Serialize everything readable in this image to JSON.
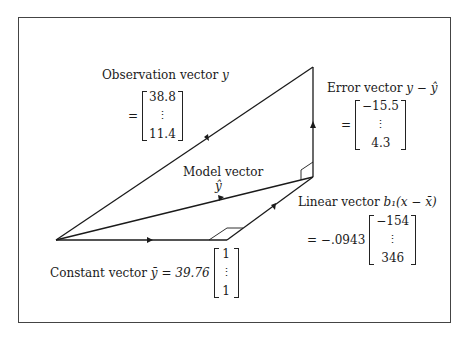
{
  "diagram": {
    "type": "vector-decomposition",
    "colors": {
      "line": "#1a1a1a",
      "frame": "#444444",
      "background": "#ffffff"
    },
    "observation": {
      "label": "Observation vector y",
      "label_text": "Observation vector",
      "symbol": "y",
      "prefix": "=",
      "matrix": [
        "38.8",
        "⋮",
        "11.4"
      ]
    },
    "error": {
      "label": "Error vector y − ŷ",
      "label_text": "Error vector",
      "symbol": "y − ŷ",
      "prefix": "=",
      "matrix": [
        "−15.5",
        "⋮",
        "4.3"
      ]
    },
    "model": {
      "label_text": "Model vector",
      "symbol": "ŷ"
    },
    "linear": {
      "label_text": "Linear vector",
      "symbol": "b₁(x − x̄)",
      "prefix": "= −.0943",
      "matrix": [
        "−154",
        "⋮",
        "346"
      ]
    },
    "constant": {
      "label_text": "Constant vector",
      "symbol": "ȳ = 39.76",
      "matrix": [
        "1",
        "⋮",
        "1"
      ]
    }
  }
}
